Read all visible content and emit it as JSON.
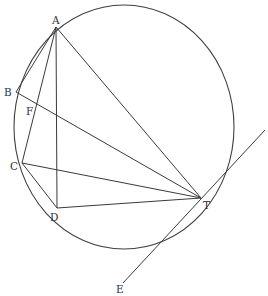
{
  "figure": {
    "type": "geometry-diagram",
    "colors": {
      "line": "#3a3a3a",
      "background": "#ffffff",
      "label": "#333333"
    }
  },
  "circle": {
    "cx": 124,
    "cy": 127,
    "rx": 110,
    "ry": 122
  },
  "points": {
    "A": {
      "label": "A",
      "x": 56,
      "y": 27
    },
    "B": {
      "label": "B",
      "x": 16,
      "y": 92
    },
    "F": {
      "label": "F",
      "x": 37,
      "y": 109
    },
    "C": {
      "label": "C",
      "x": 22,
      "y": 163
    },
    "D": {
      "label": "D",
      "x": 57,
      "y": 208
    },
    "T": {
      "label": "T",
      "x": 201,
      "y": 198
    },
    "E": {
      "label": "E",
      "x": 123,
      "y": 283
    }
  },
  "segments": [
    {
      "name": "AB",
      "from": "A",
      "to": "B"
    },
    {
      "name": "AC",
      "from": "A",
      "to": "C"
    },
    {
      "name": "AD",
      "from": "A",
      "to": "D"
    },
    {
      "name": "AT",
      "from": "A",
      "to": "T"
    },
    {
      "name": "BT",
      "from": "B",
      "to": "T"
    },
    {
      "name": "CD",
      "from": "C",
      "to": "D"
    },
    {
      "name": "CT",
      "from": "C",
      "to": "T"
    },
    {
      "name": "DT",
      "from": "D",
      "to": "T"
    },
    {
      "name": "tangent-ET",
      "from": "E",
      "to": "beyond-T"
    }
  ],
  "labels": {
    "A": "A",
    "B": "B",
    "F": "F",
    "C": "C",
    "D": "D",
    "T": "T",
    "E": "E"
  }
}
